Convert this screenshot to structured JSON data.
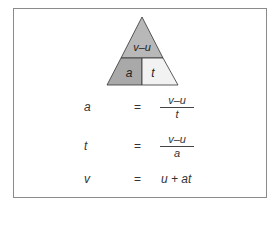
{
  "triangle": {
    "top": "v–u",
    "bottom_left": "a",
    "bottom_right": "t",
    "colors": {
      "top": "#b8b8b8",
      "bottom_left": "#a9a9a9",
      "bottom_right": "#f2f2f2",
      "stroke": "#333333"
    }
  },
  "equations": [
    {
      "lhs": "a",
      "equals": "=",
      "numerator": "v–u",
      "denominator": "t"
    },
    {
      "lhs": "t",
      "equals": "=",
      "numerator": "v–u",
      "denominator": "a"
    },
    {
      "lhs": "v",
      "equals": "=",
      "rhs": "u + at"
    }
  ]
}
